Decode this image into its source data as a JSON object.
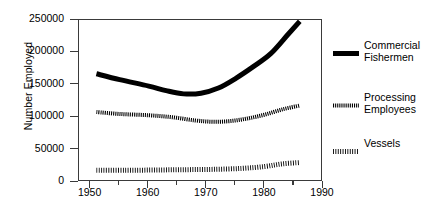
{
  "chart_data": {
    "type": "line",
    "title": "",
    "xlabel": "",
    "ylabel": "Number Employed",
    "xlim": [
      1948,
      1990
    ],
    "ylim": [
      0,
      250000
    ],
    "grid": false,
    "legend_position": "right",
    "y_ticks": [
      0,
      50000,
      100000,
      150000,
      200000,
      250000
    ],
    "y_tick_labels": [
      "0",
      "50000",
      "100000",
      "150000",
      "200000",
      "250000"
    ],
    "x_ticks_major": [
      1950,
      1960,
      1970,
      1980,
      1990
    ],
    "x_tick_labels": [
      "1950",
      "1960",
      "1970",
      "1980",
      "1990"
    ],
    "x_ticks_minor": [
      1955,
      1965,
      1975,
      1985
    ],
    "series": [
      {
        "name": "Commercial Fishermen",
        "style": "thick-solid",
        "color": "#000000",
        "x": [
          1951,
          1955,
          1960,
          1963,
          1966,
          1969,
          1972,
          1975,
          1978,
          1981,
          1984,
          1986
        ],
        "values": [
          167000,
          158000,
          148000,
          141000,
          136000,
          137000,
          145000,
          160000,
          178000,
          198000,
          228000,
          248000
        ]
      },
      {
        "name": "Processing Employees",
        "style": "medium-hatched",
        "color": "#000000",
        "x": [
          1951,
          1955,
          1960,
          1964,
          1968,
          1971,
          1974,
          1977,
          1980,
          1983,
          1986
        ],
        "values": [
          108000,
          105000,
          103000,
          100000,
          95000,
          93000,
          94000,
          98000,
          104000,
          112000,
          118000
        ]
      },
      {
        "name": "Vessels",
        "style": "fine-dotted",
        "color": "#000000",
        "x": [
          1951,
          1956,
          1961,
          1966,
          1971,
          1976,
          1980,
          1983,
          1986
        ],
        "values": [
          18000,
          18000,
          18500,
          19000,
          19500,
          21000,
          24000,
          28000,
          30000
        ]
      }
    ]
  },
  "legend": {
    "items": [
      {
        "label": "Commercial\nFishermen",
        "style": "thick-solid"
      },
      {
        "label": "Processing\nEmployees",
        "style": "medium-hatched"
      },
      {
        "label": "Vessels",
        "style": "fine-dotted"
      }
    ]
  }
}
